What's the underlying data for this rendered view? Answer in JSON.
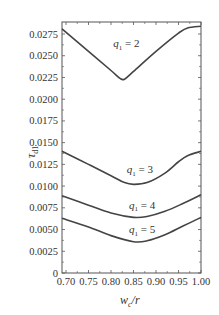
{
  "chart_data": {
    "type": "line",
    "title": "",
    "xlabel": "w_c/r",
    "ylabel": "τ_d1",
    "xlim": [
      0.69,
      1.0
    ],
    "ylim": [
      0,
      0.0288
    ],
    "xticks": [
      "0.70",
      "0.75",
      "0.80",
      "0.85",
      "0.90",
      "0.95",
      "1.00"
    ],
    "yticks": [
      "0",
      "0.0025",
      "0.0050",
      "0.0075",
      "0.0100",
      "0.0125",
      "0.0150",
      "0.0175",
      "0.0200",
      "0.0225",
      "0.0250",
      "0.0275"
    ],
    "grid": false,
    "series": [
      {
        "name": "q1 = 2",
        "label": "q",
        "sub": "1",
        "eq": " = 2",
        "x": [
          0.69,
          0.75,
          0.8,
          0.82,
          0.83,
          0.85,
          0.9,
          0.95,
          0.97,
          1.0
        ],
        "y": [
          0.0281,
          0.0255,
          0.0233,
          0.0224,
          0.0223,
          0.0232,
          0.0255,
          0.0276,
          0.0282,
          0.0284
        ]
      },
      {
        "name": "q1 = 3",
        "label": "q",
        "sub": "1",
        "eq": " = 3",
        "x": [
          0.69,
          0.75,
          0.8,
          0.83,
          0.85,
          0.88,
          0.92,
          0.95,
          0.97,
          1.0
        ],
        "y": [
          0.014,
          0.0125,
          0.0112,
          0.0104,
          0.0102,
          0.0104,
          0.0115,
          0.0128,
          0.0135,
          0.014
        ]
      },
      {
        "name": "q1 = 4",
        "label": "q",
        "sub": "1",
        "eq": " = 4",
        "x": [
          0.69,
          0.75,
          0.8,
          0.85,
          0.88,
          0.92,
          0.96,
          1.0
        ],
        "y": [
          0.0089,
          0.0078,
          0.0069,
          0.0064,
          0.0065,
          0.0071,
          0.008,
          0.009
        ]
      },
      {
        "name": "q1 = 5",
        "label": "q",
        "sub": "1",
        "eq": " = 5",
        "x": [
          0.69,
          0.75,
          0.8,
          0.85,
          0.88,
          0.92,
          0.96,
          1.0
        ],
        "y": [
          0.0063,
          0.0053,
          0.0043,
          0.0036,
          0.0037,
          0.0044,
          0.0054,
          0.0064
        ]
      }
    ],
    "annotations": [
      {
        "text": "q1 = 2",
        "x": 0.805,
        "y": 0.026
      },
      {
        "text": "q1 = 3",
        "x": 0.835,
        "y": 0.0115
      },
      {
        "text": "q1 = 4",
        "x": 0.84,
        "y": 0.0074
      },
      {
        "text": "q1 = 5",
        "x": 0.84,
        "y": 0.0046
      }
    ]
  },
  "axes": {
    "ylabel_main": "τ",
    "ylabel_sub": "d1",
    "xlabel_main": "w",
    "xlabel_sub": "c",
    "xlabel_tail": "/r"
  }
}
